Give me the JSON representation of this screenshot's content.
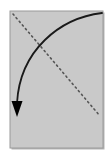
{
  "figure": {
    "title": "",
    "canvas": {
      "width": 110,
      "height": 160,
      "background_color": "#ffffff"
    },
    "panel": {
      "name": "gray-rectangle-panel",
      "x": 10,
      "y": 11,
      "width": 93,
      "height": 137,
      "fill_color": "#c9c9c9",
      "border_color": "#9a9a9a",
      "border_width": 1,
      "shadow_color": "#b4b4b4"
    },
    "dotted_line": {
      "name": "dotted-diagonal-line",
      "description": "dotted diagonal from upper-left corner to lower-right",
      "start_x": 13,
      "start_y": 14,
      "end_x": 100,
      "end_y": 116,
      "color": "#555555",
      "stroke_width": 1.6,
      "dash_pattern": "1.4 3.4",
      "style": "dotted"
    },
    "curved_arrow": {
      "name": "curved-arrow",
      "description": "solid curved arrow sweeping from upper-right corner down and left, ending in a filled triangular arrowhead pointing down",
      "start_x": 102,
      "start_y": 13,
      "control1_x": 60,
      "control1_y": 18,
      "control2_x": 20,
      "control2_y": 50,
      "end_x": 17,
      "end_y": 103,
      "color": "#1a1a1a",
      "stroke_width": 1.8,
      "arrowhead": {
        "name": "arrowhead-triangle",
        "tip_x": 17,
        "tip_y": 117,
        "left_x": 11.5,
        "left_y": 101,
        "right_x": 22.5,
        "right_y": 101,
        "fill_color": "#000000"
      }
    }
  }
}
